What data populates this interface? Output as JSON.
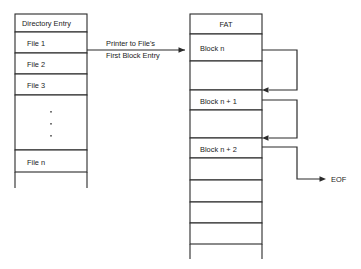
{
  "diagram": {
    "stroke_color": "#2b2b2b",
    "text_color": "#1a1a1a",
    "background": "#ffffff"
  },
  "directory_table": {
    "header": "Directory Entry",
    "rows": [
      {
        "label": "File 1"
      },
      {
        "label": "File 2"
      },
      {
        "label": "File 3"
      },
      {
        "label": ""
      },
      {
        "label": "File n"
      },
      {
        "label": ""
      }
    ],
    "ellipsis_marks": 3
  },
  "fat_table": {
    "header": "FAT",
    "rows": [
      {
        "label": "Block n"
      },
      {
        "label": ""
      },
      {
        "label": "Block n + 1"
      },
      {
        "label": ""
      },
      {
        "label": "Block n + 2"
      },
      {
        "label": ""
      },
      {
        "label": ""
      },
      {
        "label": ""
      },
      {
        "label": ""
      },
      {
        "label": ""
      }
    ]
  },
  "annotations": {
    "pointer_line1": "Printer to File's",
    "pointer_line2": "First Block Entry",
    "eof": "EOF"
  }
}
